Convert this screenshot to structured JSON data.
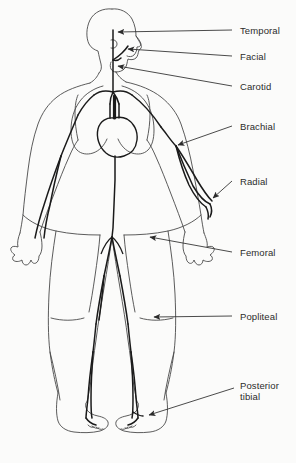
{
  "figure": {
    "background_color": "#fbfbfa",
    "outline_color": "#4a4a4a",
    "vessel_color": "#1a1a1a",
    "leader_color": "#2b2b2b",
    "text_color": "#2b2b2b"
  },
  "labels": [
    {
      "id": "temporal",
      "text": "Temporal",
      "x": 240,
      "y": 25,
      "leader": {
        "x1": 232,
        "y1": 30,
        "x2": 116,
        "y2": 32
      },
      "arrow_at": {
        "x": 116,
        "y": 32
      }
    },
    {
      "id": "facial",
      "text": "Facial",
      "x": 240,
      "y": 51,
      "leader": {
        "x1": 232,
        "y1": 56,
        "x2": 126,
        "y2": 56
      },
      "arrow_at": {
        "x": 122,
        "y": 50
      }
    },
    {
      "id": "carotid",
      "text": "Carotid",
      "x": 240,
      "y": 81,
      "leader": {
        "x1": 232,
        "y1": 86,
        "x2": 116,
        "y2": 66
      },
      "arrow_at": {
        "x": 116,
        "y": 66
      }
    },
    {
      "id": "brachial",
      "text": "Brachial",
      "x": 240,
      "y": 121,
      "leader": {
        "x1": 232,
        "y1": 126,
        "x2": 176,
        "y2": 144
      },
      "arrow_at": {
        "x": 176,
        "y": 144
      }
    },
    {
      "id": "radial",
      "text": "Radial",
      "x": 240,
      "y": 176,
      "leader": {
        "x1": 232,
        "y1": 181,
        "x2": 214,
        "y2": 199
      },
      "arrow_at": {
        "x": 214,
        "y": 199
      }
    },
    {
      "id": "femoral",
      "text": "Femoral",
      "x": 240,
      "y": 247,
      "leader": {
        "x1": 232,
        "y1": 252,
        "x2": 148,
        "y2": 237
      },
      "arrow_at": {
        "x": 148,
        "y": 237
      }
    },
    {
      "id": "popliteal",
      "text": "Popliteal",
      "x": 240,
      "y": 311,
      "leader": {
        "x1": 232,
        "y1": 316,
        "x2": 152,
        "y2": 317
      },
      "arrow_at": {
        "x": 152,
        "y": 317
      }
    },
    {
      "id": "posterior-tibial",
      "text": "Posterior\ntibial",
      "line1": "Posterior",
      "line2": "tibial",
      "x": 240,
      "y": 380,
      "leader": {
        "x1": 234,
        "y1": 388,
        "x2": 147,
        "y2": 416
      },
      "arrow_at": {
        "x": 147,
        "y": 416
      }
    }
  ]
}
